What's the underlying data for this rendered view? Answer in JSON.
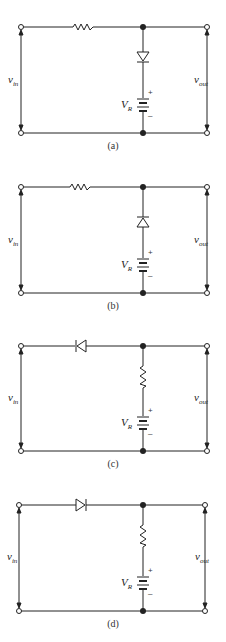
{
  "figure": {
    "panels": [
      {
        "id": "a",
        "caption": "(a)",
        "series_element": "resistor",
        "shunt_element": "diode",
        "diode_orientation": "cathode-down",
        "source_label": "V",
        "source_sub": "R",
        "plus": "+",
        "minus": "–",
        "vin": "v",
        "vin_sub": "in",
        "vout": "v",
        "vout_sub": "out"
      },
      {
        "id": "b",
        "caption": "(b)",
        "series_element": "resistor",
        "shunt_element": "diode",
        "diode_orientation": "cathode-up",
        "source_label": "V",
        "source_sub": "R",
        "plus": "+",
        "minus": "–",
        "vin": "v",
        "vin_sub": "in",
        "vout": "v",
        "vout_sub": "out"
      },
      {
        "id": "c",
        "caption": "(c)",
        "series_element": "diode",
        "diode_orientation": "cathode-left",
        "shunt_element": "resistor",
        "source_label": "V",
        "source_sub": "R",
        "plus": "+",
        "minus": "–",
        "vin": "v",
        "vin_sub": "in",
        "vout": "v",
        "vout_sub": "out"
      },
      {
        "id": "d",
        "caption": "(d)",
        "series_element": "diode",
        "diode_orientation": "cathode-right",
        "shunt_element": "resistor",
        "source_label": "V",
        "source_sub": "R",
        "plus": "+",
        "minus": "–",
        "vin": "v",
        "vin_sub": "in",
        "vout": "v",
        "vout_sub": "out"
      }
    ]
  }
}
